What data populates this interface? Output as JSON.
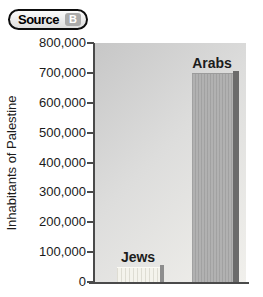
{
  "badge": {
    "label": "Source",
    "letter": "B"
  },
  "chart_data": {
    "type": "bar",
    "title": "",
    "ylabel": "Inhabitants of Palestine",
    "xlabel": "",
    "categories": [
      "Jews",
      "Arabs"
    ],
    "values": [
      50000,
      700000
    ],
    "ylim": [
      0,
      800000
    ],
    "ytick_interval": 100000,
    "ytick_labels": [
      "800,000",
      "700,000",
      "600,000",
      "500,000",
      "400,000",
      "300,000",
      "200,000",
      "100,000",
      "0"
    ],
    "grid": "off",
    "legend": "none",
    "colors": {
      "jews_bar_fill": "#f4f3ec",
      "jews_bar_shadow": "#8d8d8d",
      "arabs_bar_fill": "#b1b1b1",
      "arabs_bar_shadow": "#6b6b6b",
      "axis": "#4a4a4a",
      "plot_background_top": "#c7c7c7",
      "plot_background_bottom": "#f1f0ec"
    }
  }
}
